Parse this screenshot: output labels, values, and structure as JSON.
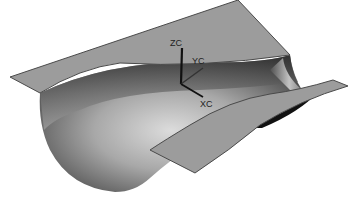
{
  "figure": {
    "colors": {
      "background": "#ffffff",
      "plane_fill": "#9c9c9c",
      "plane_edge": "#4a4a4a",
      "surface_dark": "#3a3a3a",
      "surface_light": "#d8d8d8"
    }
  },
  "triad": {
    "z_label": "ZC",
    "y_label": "YC",
    "x_label": "XC"
  }
}
